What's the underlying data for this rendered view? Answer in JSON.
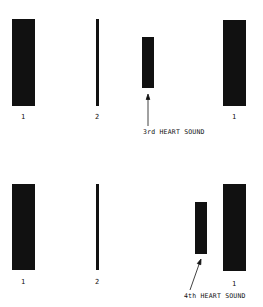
{
  "panels": [
    {
      "id": "top",
      "caption": "3rd HEART SOUND",
      "labels": [
        "1",
        "2",
        "1"
      ],
      "bars": [
        {
          "name": "S1",
          "x": 12,
          "y": 19,
          "w": 23,
          "h": 87
        },
        {
          "name": "S2",
          "x": 96,
          "y": 19,
          "w": 3,
          "h": 87
        },
        {
          "name": "S3",
          "x": 142,
          "y": 37,
          "w": 12,
          "h": 51
        },
        {
          "name": "S1-next",
          "x": 223,
          "y": 20,
          "w": 23,
          "h": 86
        }
      ]
    },
    {
      "id": "bottom",
      "caption": "4th HEART SOUND",
      "labels": [
        "1",
        "2",
        "1"
      ],
      "bars": [
        {
          "name": "S1",
          "x": 12,
          "y": 184,
          "w": 23,
          "h": 86
        },
        {
          "name": "S2",
          "x": 96,
          "y": 184,
          "w": 3,
          "h": 86
        },
        {
          "name": "S4",
          "x": 195,
          "y": 202,
          "w": 12,
          "h": 52
        },
        {
          "name": "S1-next",
          "x": 223,
          "y": 184,
          "w": 23,
          "h": 87
        }
      ]
    }
  ],
  "colors": {
    "bar": "#111111",
    "background": "#ffffff"
  }
}
